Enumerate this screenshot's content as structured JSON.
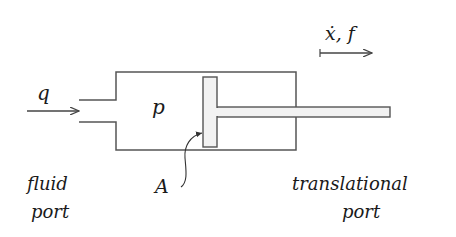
{
  "diagram": {
    "type": "hydraulic-cylinder",
    "labels": {
      "flow": "q",
      "pressure": "p",
      "area": "A",
      "velocity_force": "ẋ, f",
      "fluid_port_line1": "fluid",
      "fluid_port_line2": "port",
      "translational_port_line1": "translational",
      "translational_port_line2": "port"
    },
    "colors": {
      "stroke": "#555555",
      "piston_fill": "#f2f2f2",
      "text": "#1a1a1a"
    }
  }
}
